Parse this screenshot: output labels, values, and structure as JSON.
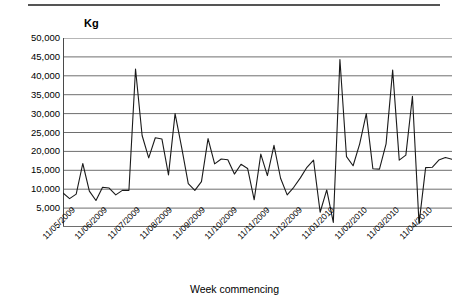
{
  "chart_data": {
    "type": "line",
    "title": "",
    "ylabel": "Kg",
    "xlabel": "Week commencing",
    "ylim": [
      0,
      50000
    ],
    "ytick_labels": [
      "50,000",
      "45,000",
      "40,000",
      "35,000",
      "30,000",
      "25,000",
      "20,000",
      "15,000",
      "10,000",
      "5,000",
      "-"
    ],
    "ytick_values": [
      50000,
      45000,
      40000,
      35000,
      30000,
      25000,
      20000,
      15000,
      10000,
      5000,
      0
    ],
    "xtick_labels": [
      "11/05/2009",
      "11/06/2009",
      "11/07/2009",
      "11/08/2009",
      "11/09/2009",
      "11/10/2009",
      "11/11/2009",
      "11/12/2009",
      "11/01/2010",
      "11/02/2010",
      "11/03/2010",
      "11/04/2010"
    ],
    "grid": true,
    "legend": "none",
    "series": [
      {
        "name": "Weekly weight (Kg)",
        "color": "#1a1a1a",
        "values": [
          9000,
          7500,
          8700,
          16800,
          9500,
          7000,
          10500,
          10300,
          8500,
          9700,
          9700,
          41800,
          24200,
          18300,
          23600,
          23300,
          13800,
          30000,
          21000,
          11500,
          9700,
          12000,
          23400,
          16700,
          18000,
          17800,
          14000,
          16600,
          15500,
          7200,
          19300,
          13600,
          21600,
          12900,
          8500,
          10500,
          13000,
          15800,
          17700,
          3900,
          9800,
          1200,
          44300,
          18600,
          16200,
          22000,
          30000,
          15400,
          15300,
          22000,
          41500,
          17700,
          19000,
          34600,
          900,
          15700,
          15800,
          17700,
          18400,
          17900
        ]
      }
    ]
  }
}
